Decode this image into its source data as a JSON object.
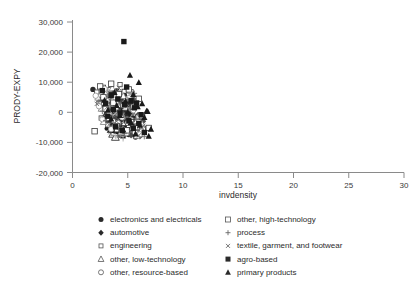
{
  "chart_data": {
    "type": "scatter",
    "title": "",
    "xlabel": "invdensity",
    "ylabel": "PRODY-EXPY",
    "xlim": [
      0,
      30
    ],
    "ylim": [
      -20000,
      30000
    ],
    "xticks": [
      "0",
      "5",
      "10",
      "15",
      "20",
      "25",
      "30"
    ],
    "xtick_values": [
      0,
      5,
      10,
      15,
      20,
      25,
      30
    ],
    "yticks": [
      "30,000",
      "20,000",
      "10,000",
      "0",
      "-10,000",
      "-20,000"
    ],
    "ytick_values": [
      30000,
      20000,
      10000,
      0,
      -10000,
      -20000
    ],
    "grid": false,
    "legend_position": "below-plot",
    "marker_colors": {
      "black": "#1a1a1a",
      "dark_gray": "#4d4d4d",
      "mid_gray": "#7d7d7d",
      "light_gray": "#a8a8a8",
      "outline": "#3a3a3a"
    },
    "series": [
      {
        "name": "electronics and electricals",
        "marker": "filled-circle",
        "color": "#2a2a2a",
        "points": [
          [
            1.85,
            7600
          ],
          [
            2.6,
            4200
          ],
          [
            2.8,
            1500
          ],
          [
            3.0,
            -1200
          ],
          [
            3.1,
            5300
          ],
          [
            3.3,
            2600
          ],
          [
            3.4,
            -3400
          ],
          [
            3.5,
            6400
          ],
          [
            3.6,
            300
          ],
          [
            3.7,
            -5200
          ],
          [
            3.8,
            3900
          ],
          [
            3.9,
            -1800
          ],
          [
            4.0,
            7100
          ],
          [
            4.1,
            1100
          ],
          [
            4.2,
            -4600
          ],
          [
            4.3,
            4800
          ],
          [
            4.4,
            -2400
          ],
          [
            4.5,
            2000
          ],
          [
            4.6,
            -6800
          ],
          [
            4.7,
            5600
          ],
          [
            4.8,
            -400
          ],
          [
            4.9,
            -3100
          ],
          [
            5.0,
            3300
          ],
          [
            5.1,
            -7400
          ],
          [
            5.2,
            900
          ],
          [
            5.3,
            -5600
          ],
          [
            5.4,
            2400
          ],
          [
            5.5,
            -2000
          ],
          [
            5.7,
            -8200
          ],
          [
            5.9,
            -4300
          ]
        ]
      },
      {
        "name": "automotive",
        "marker": "filled-diamond",
        "color": "#4a4a4a",
        "points": [
          [
            2.5,
            2300
          ],
          [
            2.9,
            5800
          ],
          [
            3.1,
            -2600
          ],
          [
            3.3,
            900
          ],
          [
            3.5,
            4100
          ],
          [
            3.6,
            -5000
          ],
          [
            3.8,
            1700
          ],
          [
            4.0,
            -1400
          ],
          [
            4.1,
            6200
          ],
          [
            4.3,
            -3800
          ],
          [
            4.4,
            2800
          ],
          [
            4.6,
            -600
          ],
          [
            4.7,
            -6400
          ],
          [
            4.9,
            3600
          ],
          [
            5.0,
            -2200
          ],
          [
            5.2,
            1300
          ],
          [
            5.3,
            -7600
          ],
          [
            5.5,
            4400
          ],
          [
            5.6,
            -4800
          ],
          [
            5.9,
            -1000
          ],
          [
            6.1,
            -8000
          ],
          [
            6.4,
            -3000
          ]
        ]
      },
      {
        "name": "engineering",
        "marker": "open-square-small",
        "color": "#3a3a3a",
        "points": [
          [
            2.2,
            6700
          ],
          [
            2.4,
            3100
          ],
          [
            2.6,
            -1900
          ],
          [
            2.8,
            8300
          ],
          [
            3.0,
            4600
          ],
          [
            3.2,
            -4200
          ],
          [
            3.4,
            7500
          ],
          [
            3.5,
            1900
          ],
          [
            3.7,
            -2800
          ],
          [
            3.9,
            5100
          ],
          [
            4.0,
            -5800
          ],
          [
            4.2,
            2200
          ],
          [
            4.3,
            9200
          ],
          [
            4.5,
            -700
          ],
          [
            4.6,
            -7000
          ],
          [
            4.8,
            4000
          ],
          [
            5.0,
            -3600
          ],
          [
            5.1,
            1000
          ],
          [
            5.3,
            6800
          ],
          [
            5.5,
            -5400
          ],
          [
            5.7,
            2700
          ],
          [
            5.9,
            -1600
          ],
          [
            6.2,
            -6200
          ],
          [
            6.8,
            -5400
          ],
          [
            2.0,
            -6300
          ]
        ]
      },
      {
        "name": "other, low-technology",
        "marker": "open-triangle",
        "color": "#7d7d7d",
        "points": [
          [
            2.3,
            4900
          ],
          [
            2.6,
            1200
          ],
          [
            2.8,
            -3200
          ],
          [
            3.0,
            6100
          ],
          [
            3.2,
            2500
          ],
          [
            3.4,
            -1100
          ],
          [
            3.6,
            8000
          ],
          [
            3.8,
            -4400
          ],
          [
            4.0,
            3400
          ],
          [
            4.2,
            -200
          ],
          [
            4.4,
            -6600
          ],
          [
            4.6,
            5400
          ],
          [
            4.8,
            1600
          ],
          [
            5.0,
            -2900
          ],
          [
            5.2,
            7200
          ],
          [
            5.4,
            -5100
          ],
          [
            5.6,
            2100
          ],
          [
            5.8,
            -7800
          ],
          [
            6.0,
            -1300
          ],
          [
            6.3,
            -4000
          ]
        ]
      },
      {
        "name": "other, resource-based",
        "marker": "open-circle",
        "color": "#8f8f8f",
        "points": [
          [
            2.1,
            5500
          ],
          [
            2.4,
            2000
          ],
          [
            2.7,
            -2300
          ],
          [
            2.9,
            7800
          ],
          [
            3.1,
            3800
          ],
          [
            3.3,
            -400
          ],
          [
            3.5,
            -5600
          ],
          [
            3.7,
            4300
          ],
          [
            3.9,
            1400
          ],
          [
            4.1,
            -3500
          ],
          [
            4.3,
            6500
          ],
          [
            4.5,
            -1700
          ],
          [
            4.7,
            2900
          ],
          [
            4.9,
            -6900
          ],
          [
            5.1,
            4700
          ],
          [
            5.3,
            -2600
          ],
          [
            5.5,
            700
          ],
          [
            5.8,
            -4900
          ],
          [
            6.1,
            -7300
          ]
        ]
      },
      {
        "name": "other, high-technology",
        "marker": "open-square",
        "color": "#3a3a3a",
        "points": [
          [
            2.5,
            8600
          ],
          [
            2.8,
            5000
          ],
          [
            3.0,
            1100
          ],
          [
            3.3,
            -2000
          ],
          [
            3.5,
            9500
          ],
          [
            3.7,
            3200
          ],
          [
            4.0,
            -4600
          ],
          [
            4.2,
            6000
          ],
          [
            4.4,
            -900
          ],
          [
            4.6,
            2400
          ],
          [
            4.9,
            -6000
          ],
          [
            5.1,
            7600
          ],
          [
            5.3,
            -3300
          ],
          [
            5.5,
            1800
          ],
          [
            5.8,
            -5200
          ],
          [
            6.0,
            4500
          ],
          [
            6.3,
            -1500
          ],
          [
            6.9,
            -5200
          ],
          [
            2.0,
            -6300
          ]
        ]
      },
      {
        "name": "process",
        "marker": "plus",
        "color": "#6e6e6e",
        "points": [
          [
            2.4,
            3600
          ],
          [
            2.7,
            400
          ],
          [
            3.0,
            -2700
          ],
          [
            3.2,
            5700
          ],
          [
            3.4,
            2100
          ],
          [
            3.6,
            -1500
          ],
          [
            3.9,
            7000
          ],
          [
            4.1,
            -5000
          ],
          [
            4.3,
            3000
          ],
          [
            4.5,
            -300
          ],
          [
            4.7,
            -7100
          ],
          [
            5.0,
            4200
          ],
          [
            5.2,
            1200
          ],
          [
            5.4,
            -3900
          ],
          [
            5.6,
            6300
          ],
          [
            5.9,
            -5700
          ],
          [
            6.2,
            -2100
          ],
          [
            6.5,
            -8100
          ]
        ]
      },
      {
        "name": "textile, garment, and footwear",
        "marker": "cross",
        "color": "#6e6e6e",
        "points": [
          [
            2.2,
            2800
          ],
          [
            2.6,
            6900
          ],
          [
            2.9,
            -1000
          ],
          [
            3.1,
            1600
          ],
          [
            3.3,
            -4100
          ],
          [
            3.6,
            4800
          ],
          [
            3.8,
            200
          ],
          [
            4.0,
            -3000
          ],
          [
            4.2,
            8100
          ],
          [
            4.4,
            -5500
          ],
          [
            4.6,
            3500
          ],
          [
            4.8,
            -1900
          ],
          [
            5.1,
            900
          ],
          [
            5.3,
            -6500
          ],
          [
            5.5,
            5200
          ],
          [
            5.7,
            -2500
          ],
          [
            6.0,
            -7700
          ],
          [
            6.4,
            -4500
          ]
        ]
      },
      {
        "name": "agro-based",
        "marker": "filled-square",
        "color": "#1a1a1a",
        "points": [
          [
            4.65,
            23500
          ],
          [
            2.7,
            7200
          ],
          [
            3.0,
            3000
          ],
          [
            3.2,
            -1300
          ],
          [
            3.5,
            5600
          ],
          [
            3.7,
            1000
          ],
          [
            3.9,
            -4800
          ],
          [
            4.1,
            4400
          ],
          [
            4.3,
            -200
          ],
          [
            4.5,
            -6100
          ],
          [
            4.7,
            2600
          ],
          [
            4.9,
            8400
          ],
          [
            5.1,
            -2800
          ],
          [
            5.3,
            3900
          ],
          [
            5.5,
            -5300
          ],
          [
            5.6,
            1500
          ],
          [
            5.8,
            3100
          ],
          [
            6.0,
            -3700
          ],
          [
            6.2,
            -800
          ],
          [
            6.5,
            -6700
          ]
        ]
      },
      {
        "name": "primary products",
        "marker": "filled-triangle",
        "color": "#1a1a1a",
        "points": [
          [
            5.2,
            12300
          ],
          [
            2.9,
            4000
          ],
          [
            3.2,
            700
          ],
          [
            3.5,
            -2200
          ],
          [
            3.8,
            6600
          ],
          [
            4.0,
            2300
          ],
          [
            4.3,
            -1000
          ],
          [
            4.6,
            -5900
          ],
          [
            4.8,
            3700
          ],
          [
            5.0,
            100
          ],
          [
            5.3,
            -3400
          ],
          [
            5.5,
            5900
          ],
          [
            5.7,
            -7200
          ],
          [
            5.9,
            1900
          ],
          [
            6.1,
            -4300
          ],
          [
            6.3,
            2900
          ],
          [
            6.5,
            -1700
          ],
          [
            6.7,
            400
          ],
          [
            6.9,
            -7900
          ],
          [
            7.1,
            -5600
          ],
          [
            6.8,
            300
          ],
          [
            6.0,
            9900
          ]
        ]
      }
    ],
    "cloud_core": {
      "description": "dense overplotted cluster",
      "x_range": [
        1.8,
        7.2
      ],
      "y_range": [
        -10500,
        12500
      ],
      "center": [
        4.3,
        -1500
      ]
    }
  },
  "legend": {
    "columns": [
      {
        "items": [
          {
            "label": "electronics and electricals",
            "marker": "filled-circle"
          },
          {
            "label": "automotive",
            "marker": "filled-diamond"
          },
          {
            "label": "engineering",
            "marker": "open-square-small"
          },
          {
            "label": "other, low-technology",
            "marker": "open-triangle"
          },
          {
            "label": "other, resource-based",
            "marker": "open-circle"
          }
        ]
      },
      {
        "items": [
          {
            "label": "other, high-technology",
            "marker": "open-square"
          },
          {
            "label": "process",
            "marker": "plus"
          },
          {
            "label": "textile, garment, and footwear",
            "marker": "cross"
          },
          {
            "label": "agro-based",
            "marker": "filled-square"
          },
          {
            "label": "primary products",
            "marker": "filled-triangle"
          }
        ]
      }
    ]
  }
}
